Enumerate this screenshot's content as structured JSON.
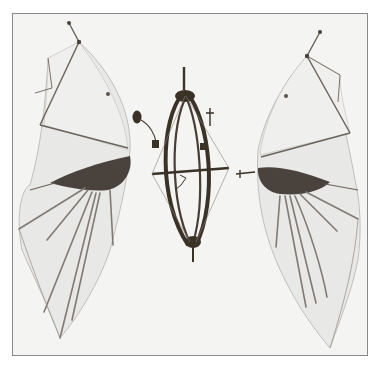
{
  "image": {
    "subject": "Ornithopter flying machine model with two membrane wings and a central elliptical frame",
    "alt_text": "Photograph of a flying machine model: left wing, central spindle-shaped frame, right wing",
    "colors": {
      "background": "#f4f4f3",
      "border": "#8a8a8a",
      "membrane": "#e6e6e4",
      "frame_wood": "#3b3028",
      "wing_root": "#4a423c",
      "rib": "#7a7570",
      "wire": "#6a625c"
    }
  }
}
